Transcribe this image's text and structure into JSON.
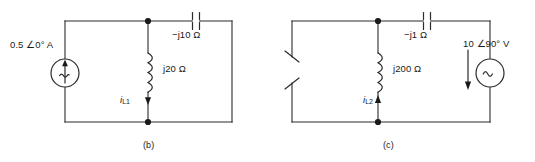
{
  "figure": {
    "line_color": "#2b2b2b",
    "background": "#ffffff"
  },
  "circuit_b": {
    "caption": "(b)",
    "source_label": "0.5 ∠0° A",
    "source_type": "ac-current-source",
    "capacitor_label": "−j10 Ω",
    "inductor_label": "j20 Ω",
    "current_symbol": "i",
    "current_subscript": "L1"
  },
  "circuit_c": {
    "caption": "(c)",
    "source_label": "10 ∠90° V",
    "source_type": "ac-voltage-source",
    "capacitor_label": "−j1 Ω",
    "inductor_label": "j200 Ω",
    "current_symbol": "i",
    "current_subscript": "L2",
    "left_branch": "broken-wire-symbol"
  }
}
